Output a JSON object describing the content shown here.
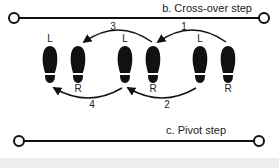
{
  "diagram": {
    "sections": [
      {
        "id": "b",
        "label": "b. Cross-over step"
      },
      {
        "id": "c",
        "label": "c. Pivot step"
      }
    ],
    "feet": [
      {
        "side": "L",
        "x": 50
      },
      {
        "side": "R",
        "x": 78
      },
      {
        "side": "L",
        "x": 125
      },
      {
        "side": "R",
        "x": 153
      },
      {
        "side": "L",
        "x": 200
      },
      {
        "side": "R",
        "x": 228
      }
    ],
    "steps": [
      {
        "number": "1",
        "position": "top"
      },
      {
        "number": "2",
        "position": "bottom"
      },
      {
        "number": "3",
        "position": "top"
      },
      {
        "number": "4",
        "position": "bottom"
      }
    ],
    "colors": {
      "ink": "#111111",
      "band": "#eeeeee"
    }
  }
}
